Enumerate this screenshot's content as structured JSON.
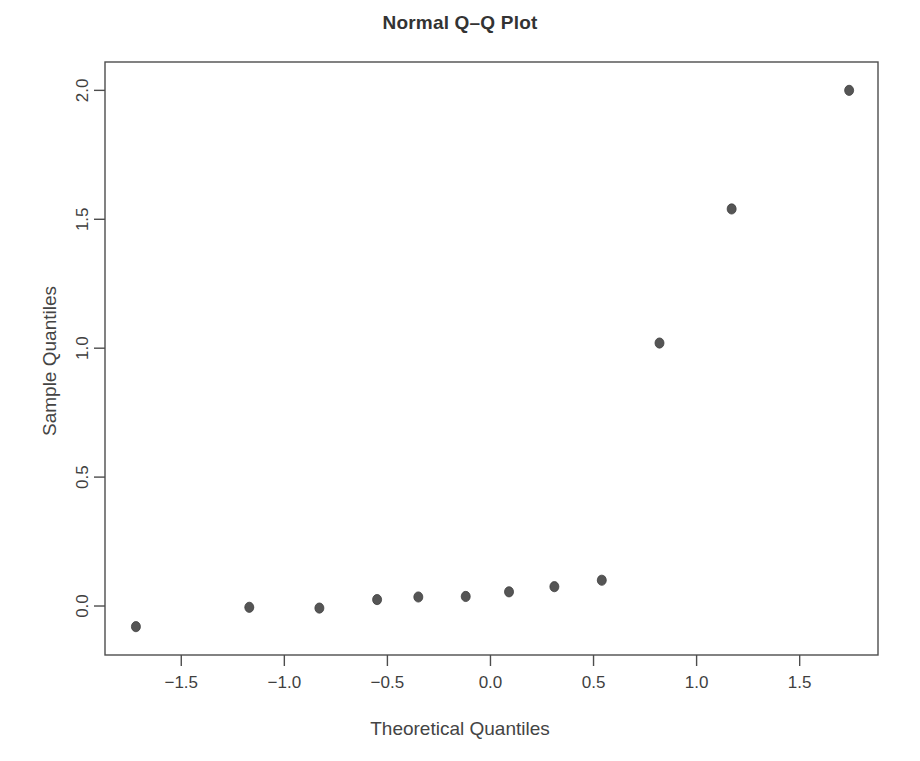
{
  "chart_data": {
    "type": "scatter",
    "title": "Normal Q–Q Plot",
    "xlabel": "Theoretical Quantiles",
    "ylabel": "Sample Quantiles",
    "xlim": [
      -1.87,
      1.88
    ],
    "ylim": [
      -0.19,
      2.11
    ],
    "grid": false,
    "legend": null,
    "xticks": [
      -1.5,
      -1.0,
      -0.5,
      0.0,
      0.5,
      1.0,
      1.5
    ],
    "xticklabels": [
      "−1.5",
      "−1.0",
      "−0.5",
      "0.0",
      "0.5",
      "1.0",
      "1.5"
    ],
    "yticks": [
      0.0,
      0.5,
      1.0,
      1.5,
      2.0
    ],
    "yticklabels": [
      "0.0",
      "0.5",
      "1.0",
      "1.5",
      "2.0"
    ],
    "point_color": "#555555",
    "point_radius": 4.5,
    "axis_color": "#4d4d4d",
    "x": [
      -1.72,
      -1.17,
      -0.83,
      -0.55,
      -0.35,
      -0.12,
      0.09,
      0.31,
      0.54,
      0.82,
      1.17,
      1.74
    ],
    "y": [
      -0.08,
      -0.005,
      -0.008,
      0.025,
      0.035,
      0.037,
      0.055,
      0.075,
      0.1,
      1.02,
      1.54,
      2.0
    ],
    "points": [
      {
        "x": -1.72,
        "y": -0.08
      },
      {
        "x": -1.17,
        "y": -0.005
      },
      {
        "x": -0.83,
        "y": -0.008
      },
      {
        "x": -0.55,
        "y": 0.025
      },
      {
        "x": -0.35,
        "y": 0.035
      },
      {
        "x": -0.12,
        "y": 0.037
      },
      {
        "x": 0.09,
        "y": 0.055
      },
      {
        "x": 0.31,
        "y": 0.075
      },
      {
        "x": 0.54,
        "y": 0.1
      },
      {
        "x": 0.82,
        "y": 1.02
      },
      {
        "x": 1.17,
        "y": 1.54
      },
      {
        "x": 1.74,
        "y": 2.0
      }
    ]
  },
  "plot_box": {
    "left": 105,
    "right": 878,
    "top": 62,
    "bottom": 655
  }
}
